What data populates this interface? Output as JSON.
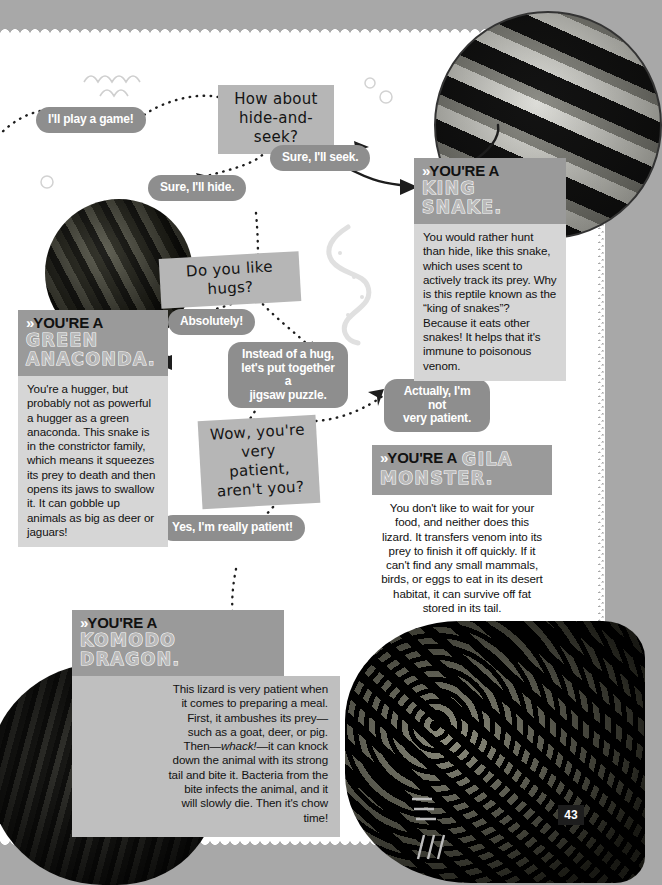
{
  "page": {
    "number": "43",
    "background_color": "#a8a8a8",
    "sheet_color": "#ffffff"
  },
  "prompts": [
    {
      "id": "hide-and-seek",
      "text": "How about\nhide-and-seek?"
    },
    {
      "id": "like-hugs",
      "text": "Do you like hugs?"
    },
    {
      "id": "very-patient",
      "text": "Wow, you're\nvery patient,\naren't you?"
    }
  ],
  "replies": [
    {
      "id": "play-a-game",
      "text": "I'll play a game!"
    },
    {
      "id": "ill-seek",
      "text": "Sure, I'll seek."
    },
    {
      "id": "ill-hide",
      "text": "Sure, I'll hide."
    },
    {
      "id": "absolutely",
      "text": "Absolutely!"
    },
    {
      "id": "jigsaw",
      "text": "Instead of a hug,\nlet's put together a\njigsaw puzzle."
    },
    {
      "id": "not-patient",
      "text": "Actually, I'm not\nvery patient."
    },
    {
      "id": "really-patient",
      "text": "Yes, I'm really patient!"
    }
  ],
  "cards": {
    "king_snake": {
      "prefix": "YOU'RE A",
      "species": "KING SNAKE.",
      "species_inline": false,
      "body": "You would rather hunt than hide, like this snake, which uses scent to actively track its prey. Why is this reptile known as the “king of snakes”? Because it eats other snakes! It helps that it's immune to poisonous venom."
    },
    "green_anaconda": {
      "prefix": "YOU'RE A",
      "species": "GREEN\nANACONDA.",
      "species_inline": false,
      "body": "You're a hugger, but probably not as powerful a hugger as a green anaconda. This snake is in the constrictor family, which means it squeezes its prey to death and then opens its jaws to swallow it. It can gobble up animals as big as deer or jaguars!"
    },
    "gila_monster": {
      "prefix": "YOU'RE A",
      "species_inline_word": "GILA",
      "species": "MONSTER.",
      "species_inline": true,
      "body": "You don't like to wait for your food, and neither does this lizard. It transfers venom into its prey to finish it off quickly. If it can't find any small mammals, birds, or eggs to eat in its desert habitat, it can survive off fat stored in its tail."
    },
    "komodo_dragon": {
      "prefix": "YOU'RE A",
      "species": "KOMODO DRAGON.",
      "species_inline": false,
      "body_pre": "This lizard is very patient when it comes to preparing a meal. First, it ambushes its prey—such as a goat, deer, or pig. Then—",
      "body_em": "whack!",
      "body_post": "—it can knock down the animal with its strong tail and bite it. Bacteria from the bite infects the animal, and it will slowly die. Then it's chow time!"
    }
  },
  "chevron_glyph": "»",
  "photos": [
    {
      "id": "anaconda-photo",
      "alt": "green anaconda coiled"
    },
    {
      "id": "king-snake-photo",
      "alt": "banded king snake"
    },
    {
      "id": "komodo-dragon-photo",
      "alt": "komodo dragon"
    },
    {
      "id": "gila-monster-photo",
      "alt": "gila monster lizard"
    }
  ],
  "colors": {
    "bubble": "#8e8e8e",
    "qbox": "#b6b6b6",
    "card_header": "#9a9a9a",
    "card_body": "#d6d6d6",
    "text_dark": "#111111",
    "text_light": "#ffffff"
  }
}
